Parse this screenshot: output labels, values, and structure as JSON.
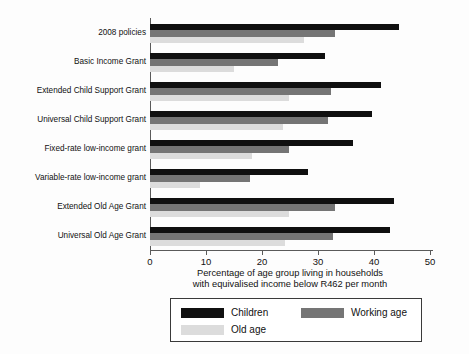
{
  "chart_data": {
    "type": "bar",
    "orientation": "horizontal",
    "title": "",
    "xlabel": "Percentage of age group living in households with equivalised income below R462 per month",
    "xlabel_line1": "Percentage of age group living in households",
    "xlabel_line2": "with equivalised income below R462 per month",
    "ylabel": "",
    "xlim": [
      0,
      50
    ],
    "xticks": [
      0,
      10,
      20,
      30,
      40,
      50
    ],
    "xticklabels": [
      "0",
      "10",
      "20",
      "30",
      "40",
      "50"
    ],
    "grid": false,
    "legend_position": "below-center",
    "categories": [
      "2008 policies",
      "Basic Income Grant",
      "Extended Child Support Grant",
      "Universal Child Support Grant",
      "Fixed-rate low-income grant",
      "Variable-rate low-income grant",
      "Extended Old Age Grant",
      "Universal Old Age Grant"
    ],
    "series": [
      {
        "name": "Children",
        "color": "#101010",
        "values": [
          44.4,
          31.3,
          41.3,
          39.6,
          36.2,
          28.2,
          43.6,
          42.8
        ]
      },
      {
        "name": "Working age",
        "color": "#757575",
        "values": [
          33.0,
          22.9,
          32.4,
          31.7,
          24.9,
          17.8,
          33.0,
          32.7
        ]
      },
      {
        "name": "Old age",
        "color": "#dcdcdc",
        "values": [
          27.5,
          15.0,
          24.8,
          23.8,
          18.2,
          9.0,
          24.8,
          24.1
        ]
      }
    ]
  },
  "legend": {
    "entries": [
      {
        "label": "Children",
        "color": "#101010"
      },
      {
        "label": "Working age",
        "color": "#757575"
      },
      {
        "label": "Old age",
        "color": "#dcdcdc"
      }
    ]
  }
}
